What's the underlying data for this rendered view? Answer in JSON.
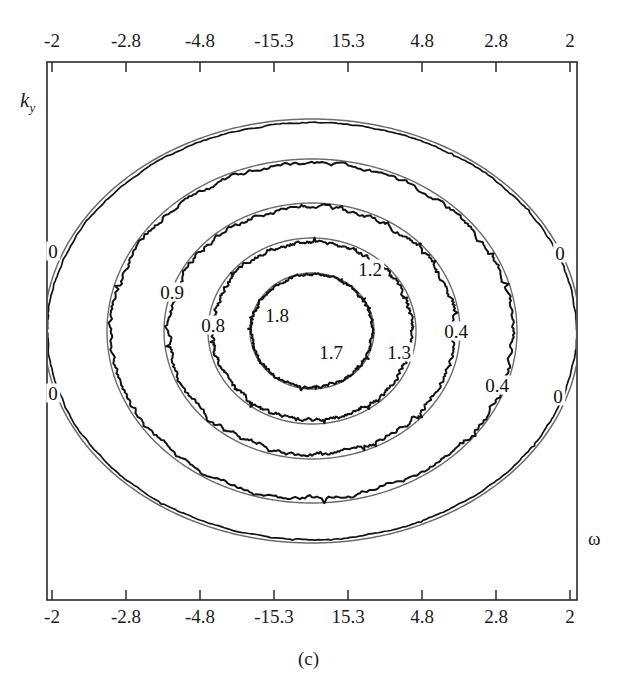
{
  "figure": {
    "caption": "(c)",
    "axis_titles": {
      "x": "ω",
      "y_main": "k",
      "y_sub": "y"
    }
  },
  "chart_data": {
    "type": "line",
    "title": "(c)",
    "xlabel": "ω",
    "ylabel": "k_y",
    "grid": false,
    "legend": "none",
    "x_tick_labels_top": [
      "-2",
      "-2.8",
      "-4.8",
      "-15.3",
      "15.3",
      "4.8",
      "2.8",
      "2"
    ],
    "x_tick_labels_bottom": [
      "-2",
      "-2.8",
      "-4.8",
      "-15.3",
      "15.3",
      "4.8",
      "2.8",
      "2"
    ],
    "x_tick_positions_px": [
      52,
      126,
      200,
      274,
      348,
      422,
      496,
      570
    ],
    "y_tick_labels": [],
    "plot_box_px": {
      "left": 47,
      "top": 62,
      "right": 577,
      "bottom": 600
    },
    "contour_labels": [
      {
        "text": "0",
        "x": 53,
        "y": 251
      },
      {
        "text": "0",
        "x": 560,
        "y": 253
      },
      {
        "text": "0",
        "x": 53,
        "y": 393
      },
      {
        "text": "0",
        "x": 558,
        "y": 396
      },
      {
        "text": "0.9",
        "x": 172,
        "y": 292
      },
      {
        "text": "0.8",
        "x": 213,
        "y": 325
      },
      {
        "text": "1.8",
        "x": 277,
        "y": 315
      },
      {
        "text": "1.7",
        "x": 331,
        "y": 352
      },
      {
        "text": "1.2",
        "x": 370,
        "y": 269
      },
      {
        "text": "1.3",
        "x": 399,
        "y": 352
      },
      {
        "text": "0.4",
        "x": 456,
        "y": 331
      },
      {
        "text": "0.4",
        "x": 497,
        "y": 385
      }
    ],
    "contours": [
      {
        "level": "0",
        "rx": 268,
        "ry": 212,
        "open": true
      },
      {
        "level": "0.4",
        "rx": 205,
        "ry": 172,
        "open": false
      },
      {
        "level": "0.9",
        "rx": 148,
        "ry": 128,
        "open": false
      },
      {
        "level": "1.2",
        "rx": 104,
        "ry": 93,
        "open": false
      },
      {
        "level": "1.7",
        "rx": 62,
        "ry": 58,
        "open": false
      }
    ],
    "center_px": {
      "x": 312,
      "y": 331
    },
    "series": [
      {
        "name": "theoretical",
        "style": "smooth",
        "color": "#6b6b6b"
      },
      {
        "name": "simulated",
        "style": "jagged",
        "color": "#121212"
      }
    ]
  }
}
